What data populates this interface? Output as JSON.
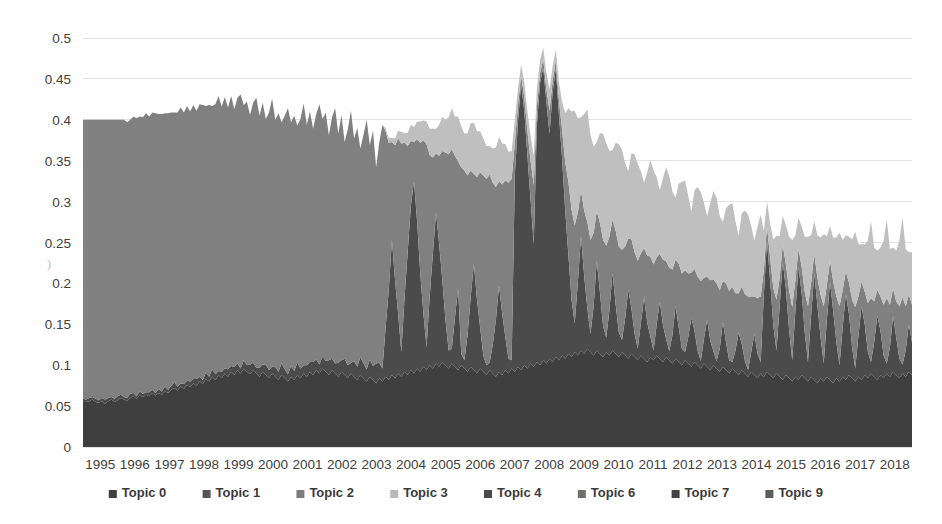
{
  "chart_data": {
    "type": "area",
    "stacked": true,
    "title": "",
    "subtitle": "",
    "xlabel": "",
    "ylabel": "",
    "xlim": [
      1995,
      2018.9
    ],
    "ylim": [
      0,
      0.5
    ],
    "grid": "horizontal-only",
    "legend_position": "bottom",
    "background": "#ffffff",
    "x_tick_labels": [
      "1995",
      "1996",
      "1997",
      "1998",
      "1999",
      "2000",
      "2001",
      "2002",
      "2003",
      "2004",
      "2005",
      "2006",
      "2007",
      "2008",
      "2009",
      "2010",
      "2011",
      "2012",
      "2013",
      "2014",
      "2015",
      "2016",
      "2017",
      "2018"
    ],
    "y_tick_labels": [
      "0",
      "0.05",
      "0.1",
      "0.15",
      "0.2",
      "0.25",
      "0.3",
      "0.35",
      "0.4",
      "0.45",
      "0.5"
    ],
    "y_tick_values": [
      0,
      0.05,
      0.1,
      0.15,
      0.2,
      0.25,
      0.3,
      0.35,
      0.4,
      0.45,
      0.5
    ],
    "legend": [
      {
        "name": "Topic 0",
        "color": "#3f3f3f"
      },
      {
        "name": "Topic 1",
        "color": "#555555"
      },
      {
        "name": "Topic 2",
        "color": "#7d7d7d"
      },
      {
        "name": "Topic 3",
        "color": "#b9b9b9"
      },
      {
        "name": "Topic 4",
        "color": "#4a4a4a"
      },
      {
        "name": "Topic 6",
        "color": "#6e6e6e"
      },
      {
        "name": "Topic 7",
        "color": "#424242"
      },
      {
        "name": "Topic 9",
        "color": "#5c5c5c"
      }
    ],
    "series": [
      {
        "name": "Topic 0",
        "color": "#3f3f3f",
        "values": [
          0.055,
          0.055,
          0.056,
          0.058,
          0.055,
          0.054,
          0.056,
          0.053,
          0.056,
          0.058,
          0.055,
          0.057,
          0.06,
          0.058,
          0.056,
          0.06,
          0.062,
          0.059,
          0.063,
          0.061,
          0.064,
          0.062,
          0.066,
          0.063,
          0.066,
          0.064,
          0.068,
          0.066,
          0.07,
          0.072,
          0.069,
          0.074,
          0.071,
          0.076,
          0.073,
          0.078,
          0.075,
          0.08,
          0.077,
          0.083,
          0.08,
          0.086,
          0.082,
          0.088,
          0.084,
          0.09,
          0.086,
          0.092,
          0.088,
          0.094,
          0.09,
          0.096,
          0.092,
          0.089,
          0.094,
          0.09,
          0.086,
          0.092,
          0.088,
          0.084,
          0.09,
          0.086,
          0.082,
          0.088,
          0.084,
          0.08,
          0.086,
          0.082,
          0.088,
          0.084,
          0.09,
          0.086,
          0.092,
          0.088,
          0.094,
          0.09,
          0.096,
          0.092,
          0.088,
          0.094,
          0.09,
          0.086,
          0.092,
          0.088,
          0.084,
          0.09,
          0.086,
          0.082,
          0.088,
          0.084,
          0.08,
          0.086,
          0.082,
          0.078,
          0.084,
          0.08,
          0.086,
          0.082,
          0.088,
          0.084,
          0.09,
          0.086,
          0.092,
          0.088,
          0.094,
          0.09,
          0.096,
          0.092,
          0.098,
          0.094,
          0.1,
          0.096,
          0.102,
          0.098,
          0.104,
          0.1,
          0.096,
          0.102,
          0.098,
          0.094,
          0.1,
          0.096,
          0.092,
          0.098,
          0.094,
          0.09,
          0.096,
          0.092,
          0.088,
          0.094,
          0.09,
          0.086,
          0.092,
          0.088,
          0.094,
          0.09,
          0.096,
          0.092,
          0.098,
          0.094,
          0.1,
          0.096,
          0.102,
          0.098,
          0.104,
          0.1,
          0.106,
          0.102,
          0.108,
          0.104,
          0.11,
          0.106,
          0.112,
          0.108,
          0.114,
          0.11,
          0.116,
          0.112,
          0.118,
          0.114,
          0.12,
          0.116,
          0.112,
          0.118,
          0.114,
          0.11,
          0.116,
          0.112,
          0.118,
          0.114,
          0.11,
          0.116,
          0.112,
          0.108,
          0.114,
          0.11,
          0.106,
          0.112,
          0.108,
          0.104,
          0.11,
          0.106,
          0.112,
          0.108,
          0.104,
          0.11,
          0.106,
          0.102,
          0.108,
          0.104,
          0.1,
          0.106,
          0.102,
          0.098,
          0.104,
          0.1,
          0.096,
          0.102,
          0.098,
          0.094,
          0.1,
          0.096,
          0.092,
          0.098,
          0.094,
          0.09,
          0.096,
          0.092,
          0.088,
          0.094,
          0.09,
          0.086,
          0.092,
          0.088,
          0.084,
          0.09,
          0.086,
          0.092,
          0.088,
          0.084,
          0.09,
          0.086,
          0.082,
          0.088,
          0.084,
          0.08,
          0.086,
          0.082,
          0.088,
          0.084,
          0.08,
          0.086,
          0.082,
          0.078,
          0.084,
          0.08,
          0.086,
          0.082,
          0.078,
          0.084,
          0.08,
          0.086,
          0.082,
          0.088,
          0.084,
          0.08,
          0.086,
          0.082,
          0.088,
          0.084,
          0.09,
          0.086,
          0.082,
          0.088,
          0.084,
          0.09,
          0.086,
          0.092,
          0.088,
          0.084,
          0.09,
          0.086,
          0.092,
          0.088
        ]
      },
      {
        "name": "Topic 7",
        "color": "#4b4b4b",
        "values": [
          0.004,
          0.003,
          0.004,
          0.003,
          0.004,
          0.003,
          0.004,
          0.005,
          0.004,
          0.003,
          0.004,
          0.005,
          0.004,
          0.003,
          0.004,
          0.005,
          0.004,
          0.003,
          0.005,
          0.004,
          0.003,
          0.005,
          0.004,
          0.003,
          0.005,
          0.004,
          0.006,
          0.004,
          0.005,
          0.007,
          0.005,
          0.004,
          0.006,
          0.005,
          0.007,
          0.005,
          0.008,
          0.006,
          0.005,
          0.008,
          0.006,
          0.009,
          0.007,
          0.005,
          0.008,
          0.006,
          0.009,
          0.007,
          0.01,
          0.008,
          0.006,
          0.01,
          0.008,
          0.012,
          0.009,
          0.007,
          0.011,
          0.009,
          0.013,
          0.01,
          0.008,
          0.012,
          0.01,
          0.014,
          0.011,
          0.009,
          0.013,
          0.011,
          0.015,
          0.012,
          0.01,
          0.014,
          0.012,
          0.016,
          0.013,
          0.011,
          0.015,
          0.013,
          0.018,
          0.014,
          0.012,
          0.017,
          0.014,
          0.02,
          0.016,
          0.013,
          0.019,
          0.016,
          0.022,
          0.018,
          0.015,
          0.021,
          0.017,
          0.024,
          0.019,
          0.016,
          0.06,
          0.11,
          0.165,
          0.12,
          0.072,
          0.03,
          0.09,
          0.15,
          0.2,
          0.235,
          0.18,
          0.12,
          0.065,
          0.028,
          0.085,
          0.14,
          0.185,
          0.15,
          0.1,
          0.055,
          0.022,
          0.018,
          0.06,
          0.1,
          0.014,
          0.01,
          0.045,
          0.085,
          0.13,
          0.09,
          0.05,
          0.02,
          0.012,
          0.009,
          0.035,
          0.07,
          0.105,
          0.075,
          0.04,
          0.018,
          0.01,
          0.24,
          0.3,
          0.35,
          0.31,
          0.26,
          0.2,
          0.15,
          0.29,
          0.345,
          0.358,
          0.32,
          0.275,
          0.33,
          0.352,
          0.3,
          0.24,
          0.18,
          0.12,
          0.07,
          0.035,
          0.09,
          0.14,
          0.095,
          0.05,
          0.022,
          0.06,
          0.11,
          0.075,
          0.038,
          0.018,
          0.055,
          0.095,
          0.06,
          0.03,
          0.015,
          0.045,
          0.085,
          0.055,
          0.028,
          0.014,
          0.04,
          0.075,
          0.048,
          0.025,
          0.012,
          0.038,
          0.07,
          0.045,
          0.022,
          0.011,
          0.035,
          0.065,
          0.042,
          0.02,
          0.01,
          0.032,
          0.06,
          0.038,
          0.018,
          0.009,
          0.03,
          0.058,
          0.036,
          0.017,
          0.009,
          0.028,
          0.055,
          0.034,
          0.016,
          0.008,
          0.026,
          0.052,
          0.032,
          0.015,
          0.008,
          0.024,
          0.05,
          0.03,
          0.014,
          0.1,
          0.16,
          0.115,
          0.065,
          0.028,
          0.085,
          0.145,
          0.105,
          0.06,
          0.026,
          0.08,
          0.138,
          0.1,
          0.055,
          0.024,
          0.075,
          0.13,
          0.095,
          0.05,
          0.022,
          0.07,
          0.12,
          0.088,
          0.045,
          0.02,
          0.06,
          0.105,
          0.075,
          0.038,
          0.016,
          0.05,
          0.09,
          0.062,
          0.032,
          0.014,
          0.042,
          0.078,
          0.054,
          0.028,
          0.012,
          0.036,
          0.068,
          0.046,
          0.024,
          0.011,
          0.032,
          0.058,
          0.04
        ]
      },
      {
        "name": "Topic 2",
        "color": "#808080",
        "values": [
          0.341,
          0.342,
          0.34,
          0.339,
          0.341,
          0.343,
          0.34,
          0.342,
          0.34,
          0.339,
          0.341,
          0.338,
          0.336,
          0.339,
          0.337,
          0.335,
          0.338,
          0.34,
          0.336,
          0.338,
          0.341,
          0.337,
          0.339,
          0.342,
          0.336,
          0.339,
          0.334,
          0.338,
          0.334,
          0.33,
          0.335,
          0.337,
          0.332,
          0.336,
          0.33,
          0.335,
          0.328,
          0.333,
          0.336,
          0.326,
          0.332,
          0.322,
          0.33,
          0.336,
          0.324,
          0.332,
          0.32,
          0.33,
          0.315,
          0.325,
          0.335,
          0.312,
          0.322,
          0.305,
          0.318,
          0.33,
          0.308,
          0.32,
          0.3,
          0.315,
          0.328,
          0.302,
          0.316,
          0.295,
          0.31,
          0.325,
          0.298,
          0.312,
          0.29,
          0.305,
          0.32,
          0.294,
          0.306,
          0.285,
          0.3,
          0.318,
          0.29,
          0.304,
          0.275,
          0.295,
          0.312,
          0.28,
          0.3,
          0.265,
          0.288,
          0.308,
          0.272,
          0.292,
          0.255,
          0.28,
          0.305,
          0.262,
          0.288,
          0.24,
          0.27,
          0.298,
          0.24,
          0.18,
          0.12,
          0.165,
          0.215,
          0.255,
          0.19,
          0.13,
          0.08,
          0.048,
          0.1,
          0.16,
          0.212,
          0.248,
          0.172,
          0.118,
          0.072,
          0.108,
          0.158,
          0.205,
          0.24,
          0.244,
          0.198,
          0.155,
          0.228,
          0.232,
          0.195,
          0.155,
          0.11,
          0.15,
          0.19,
          0.22,
          0.228,
          0.23,
          0.198,
          0.162,
          0.128,
          0.158,
          0.192,
          0.215,
          0.222,
          0.04,
          0.02,
          0.01,
          0.018,
          0.03,
          0.048,
          0.072,
          0.022,
          0.012,
          0.01,
          0.016,
          0.028,
          0.014,
          0.01,
          0.018,
          0.035,
          0.06,
          0.09,
          0.11,
          0.12,
          0.085,
          0.055,
          0.08,
          0.105,
          0.115,
          0.09,
          0.06,
          0.085,
          0.105,
          0.112,
          0.09,
          0.065,
          0.09,
          0.105,
          0.11,
          0.088,
          0.062,
          0.085,
          0.1,
          0.108,
          0.085,
          0.06,
          0.082,
          0.098,
          0.105,
          0.082,
          0.058,
          0.08,
          0.095,
          0.102,
          0.08,
          0.056,
          0.078,
          0.092,
          0.1,
          0.078,
          0.055,
          0.076,
          0.09,
          0.098,
          0.075,
          0.052,
          0.074,
          0.088,
          0.095,
          0.072,
          0.05,
          0.072,
          0.085,
          0.092,
          0.07,
          0.048,
          0.07,
          0.082,
          0.09,
          0.068,
          0.046,
          0.068,
          0.08,
          0.03,
          0.018,
          0.028,
          0.045,
          0.062,
          0.035,
          0.02,
          0.03,
          0.048,
          0.065,
          0.038,
          0.022,
          0.032,
          0.05,
          0.068,
          0.04,
          0.024,
          0.034,
          0.052,
          0.07,
          0.042,
          0.026,
          0.036,
          0.055,
          0.072,
          0.045,
          0.028,
          0.038,
          0.058,
          0.075,
          0.048,
          0.03,
          0.04,
          0.06,
          0.078,
          0.05,
          0.032,
          0.042,
          0.062,
          0.08,
          0.052,
          0.034,
          0.044,
          0.064,
          0.082,
          0.054,
          0.036,
          0.046
        ]
      },
      {
        "name": "Topic 3",
        "color": "#bfbfbf",
        "values": [
          0.0,
          0.0,
          0.0,
          0.0,
          0.0,
          0.0,
          0.0,
          0.0,
          0.0,
          0.0,
          0.0,
          0.0,
          0.0,
          0.0,
          0.0,
          0.0,
          0.0,
          0.0,
          0.0,
          0.0,
          0.0,
          0.0,
          0.0,
          0.0,
          0.0,
          0.0,
          0.0,
          0.0,
          0.0,
          0.0,
          0.0,
          0.0,
          0.0,
          0.0,
          0.0,
          0.0,
          0.0,
          0.0,
          0.0,
          0.0,
          0.0,
          0.0,
          0.0,
          0.0,
          0.0,
          0.0,
          0.0,
          0.0,
          0.0,
          0.0,
          0.0,
          0.0,
          0.0,
          0.0,
          0.0,
          0.0,
          0.0,
          0.0,
          0.0,
          0.0,
          0.0,
          0.0,
          0.0,
          0.0,
          0.0,
          0.0,
          0.0,
          0.0,
          0.0,
          0.0,
          0.0,
          0.0,
          0.0,
          0.0,
          0.0,
          0.0,
          0.0,
          0.0,
          0.0,
          0.0,
          0.0,
          0.0,
          0.0,
          0.0,
          0.0,
          0.0,
          0.0,
          0.0,
          0.0,
          0.0,
          0.0,
          0.0,
          0.0,
          0.0,
          0.0,
          0.0,
          0.004,
          0.006,
          0.005,
          0.008,
          0.01,
          0.014,
          0.012,
          0.016,
          0.02,
          0.018,
          0.022,
          0.026,
          0.024,
          0.028,
          0.032,
          0.035,
          0.03,
          0.038,
          0.042,
          0.04,
          0.045,
          0.05,
          0.048,
          0.055,
          0.05,
          0.045,
          0.052,
          0.058,
          0.062,
          0.056,
          0.05,
          0.045,
          0.04,
          0.035,
          0.042,
          0.048,
          0.054,
          0.05,
          0.044,
          0.038,
          0.034,
          0.028,
          0.02,
          0.014,
          0.018,
          0.024,
          0.03,
          0.036,
          0.022,
          0.016,
          0.014,
          0.02,
          0.026,
          0.018,
          0.014,
          0.022,
          0.035,
          0.06,
          0.09,
          0.12,
          0.14,
          0.115,
          0.09,
          0.118,
          0.138,
          0.128,
          0.105,
          0.085,
          0.11,
          0.13,
          0.125,
          0.105,
          0.085,
          0.108,
          0.125,
          0.122,
          0.102,
          0.082,
          0.105,
          0.12,
          0.118,
          0.1,
          0.08,
          0.102,
          0.118,
          0.115,
          0.098,
          0.078,
          0.1,
          0.115,
          0.112,
          0.095,
          0.076,
          0.098,
          0.112,
          0.11,
          0.095,
          0.075,
          0.096,
          0.11,
          0.108,
          0.092,
          0.074,
          0.094,
          0.108,
          0.105,
          0.09,
          0.072,
          0.092,
          0.105,
          0.102,
          0.088,
          0.07,
          0.09,
          0.102,
          0.1,
          0.086,
          0.068,
          0.088,
          0.1,
          0.048,
          0.03,
          0.042,
          0.06,
          0.078,
          0.052,
          0.035,
          0.048,
          0.065,
          0.082,
          0.055,
          0.038,
          0.05,
          0.068,
          0.085,
          0.058,
          0.04,
          0.052,
          0.07,
          0.088,
          0.06,
          0.042,
          0.054,
          0.072,
          0.09,
          0.062,
          0.044,
          0.056,
          0.074,
          0.092,
          0.064,
          0.046,
          0.058,
          0.076,
          0.094,
          0.066,
          0.048,
          0.06,
          0.078,
          0.096,
          0.068,
          0.05,
          0.062,
          0.08,
          0.098,
          0.07,
          0.052,
          0.064
        ]
      }
    ]
  },
  "axes": {
    "plot_left": 83,
    "plot_right": 912,
    "plot_top": 38,
    "plot_bottom": 447
  },
  "artifacts": {
    "stray_mark": ")"
  }
}
